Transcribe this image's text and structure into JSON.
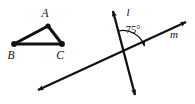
{
  "figure": {
    "background_color": "#ffffff",
    "ink_color": "#111111",
    "triangle": {
      "name": "triangle-abc",
      "vertices": [
        {
          "label": "A",
          "x": 48,
          "y": 26,
          "label_x": 45,
          "label_y": 17
        },
        {
          "label": "B",
          "x": 14,
          "y": 44,
          "label_x": 10,
          "label_y": 58
        },
        {
          "label": "C",
          "x": 62,
          "y": 44,
          "label_x": 59,
          "label_y": 58
        }
      ],
      "edges": [
        {
          "name": "edge-ab",
          "from": "B",
          "to": "A"
        },
        {
          "name": "edge-ac",
          "from": "A",
          "to": "C"
        },
        {
          "name": "edge-bc",
          "from": "B",
          "to": "C"
        }
      ]
    },
    "lines": [
      {
        "name": "line-l",
        "label": "l",
        "label_x": 127,
        "label_y": 15,
        "x1": 112,
        "y1": 7,
        "x2": 136,
        "y2": 99,
        "arrow_start": true,
        "arrow_end": true
      },
      {
        "name": "line-m",
        "label": "m",
        "label_x": 174,
        "label_y": 37,
        "x1": 34,
        "y1": 92,
        "x2": 190,
        "y2": 20,
        "arrow_start": true,
        "arrow_end": true
      }
    ],
    "intersection": {
      "x": 124,
      "y": 52
    },
    "angle": {
      "name": "angle-75",
      "value": "75",
      "unit": "°",
      "display": "75°",
      "label_x": 130,
      "label_y": 33,
      "arc_radius": 22
    }
  }
}
